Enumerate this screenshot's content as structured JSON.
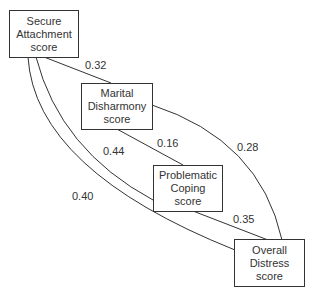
{
  "diagram": {
    "type": "path-diagram",
    "nodes": [
      {
        "id": "secure",
        "lines": [
          "Secure",
          "Attachment",
          "score"
        ]
      },
      {
        "id": "marital",
        "lines": [
          "Marital",
          "Disharmony",
          "score"
        ]
      },
      {
        "id": "coping",
        "lines": [
          "Problematic",
          "Coping",
          "score"
        ]
      },
      {
        "id": "distress",
        "lines": [
          "Overall",
          "Distress",
          "score"
        ]
      }
    ],
    "edges": [
      {
        "from": "secure",
        "to": "marital",
        "label": "0.32"
      },
      {
        "from": "marital",
        "to": "coping",
        "label": "0.16"
      },
      {
        "from": "marital",
        "to": "distress",
        "label": "0.28"
      },
      {
        "from": "secure",
        "to": "coping",
        "label": "0.44"
      },
      {
        "from": "secure",
        "to": "distress",
        "label": "0.40"
      },
      {
        "from": "coping",
        "to": "distress",
        "label": "0.35"
      }
    ],
    "stroke_color": "#333333"
  }
}
